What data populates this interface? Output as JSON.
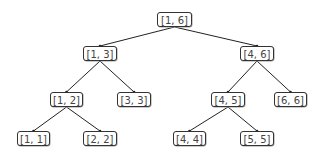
{
  "diagram": {
    "type": "segment-tree",
    "nodes": [
      {
        "id": "n16",
        "label": "[1, 6]",
        "x": 157,
        "y": 12,
        "w": 35
      },
      {
        "id": "n13",
        "label": "[1, 3]",
        "x": 83,
        "y": 46,
        "w": 34
      },
      {
        "id": "n46",
        "label": "[4, 6]",
        "x": 240,
        "y": 46,
        "w": 34
      },
      {
        "id": "n12",
        "label": "[1, 2]",
        "x": 50,
        "y": 92,
        "w": 33
      },
      {
        "id": "n33",
        "label": "[3, 3]",
        "x": 117,
        "y": 92,
        "w": 34
      },
      {
        "id": "n45",
        "label": "[4, 5]",
        "x": 211,
        "y": 92,
        "w": 34
      },
      {
        "id": "n66",
        "label": "[6, 6]",
        "x": 274,
        "y": 92,
        "w": 33
      },
      {
        "id": "n11",
        "label": "[1, 1]",
        "x": 17,
        "y": 131,
        "w": 33
      },
      {
        "id": "n22",
        "label": "[2, 2]",
        "x": 83,
        "y": 131,
        "w": 34
      },
      {
        "id": "n44",
        "label": "[4, 4]",
        "x": 173,
        "y": 131,
        "w": 33
      },
      {
        "id": "n55",
        "label": "[5, 5]",
        "x": 240,
        "y": 131,
        "w": 34
      }
    ],
    "edges": [
      [
        "n16",
        "n13"
      ],
      [
        "n16",
        "n46"
      ],
      [
        "n13",
        "n12"
      ],
      [
        "n13",
        "n33"
      ],
      [
        "n46",
        "n45"
      ],
      [
        "n46",
        "n66"
      ],
      [
        "n12",
        "n11"
      ],
      [
        "n12",
        "n22"
      ],
      [
        "n45",
        "n44"
      ],
      [
        "n45",
        "n55"
      ]
    ]
  }
}
